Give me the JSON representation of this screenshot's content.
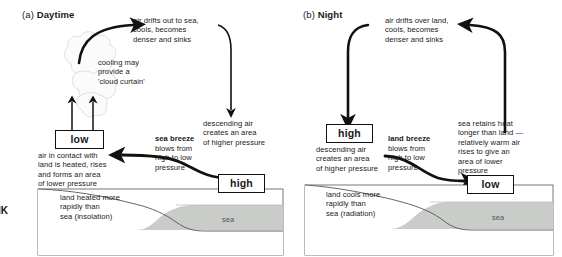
{
  "figure": {
    "side_mark": "IK",
    "sea_color": "#c9ccc9",
    "land_color": "#ffffff",
    "line_color": "#111111"
  },
  "panel_a": {
    "label": "(a)",
    "name": "Daytime",
    "notes": {
      "drift": "air drifts out to sea,\ncools, becomes\ndenser and sinks",
      "cooling": "cooling may\nprovide a\n'cloud curtain'",
      "descending": "descending air\ncreates an area\nof higher pressure",
      "low_desc": "air in contact with\nland is heated, rises\nand forms an area\nof lower pressure",
      "land": "land heated more\nrapidly than\nsea (insolation)",
      "breeze_lead": "sea breeze",
      "breeze_body": "blows from\nhigh to low\npressure"
    },
    "boxes": {
      "low": "low",
      "high": "high"
    },
    "sea_label": "sea"
  },
  "panel_b": {
    "label": "(b)",
    "name": "Night",
    "notes": {
      "drift": "air drifts over land,\ncools, becomes\ndenser and sinks",
      "descending": "descending air\ncreates an area\nof higher pressure",
      "sea_retains": "sea retains heat\nlonger than land —\nrelatively warm air\nrises to give an\narea of lower\npressure",
      "land": "land cools more\nrapidly than\nsea (radiation)",
      "breeze_lead": "land breeze",
      "breeze_body": "blows from\nhigh to low\npressure"
    },
    "boxes": {
      "high": "high",
      "low": "low"
    },
    "sea_label": "sea"
  }
}
